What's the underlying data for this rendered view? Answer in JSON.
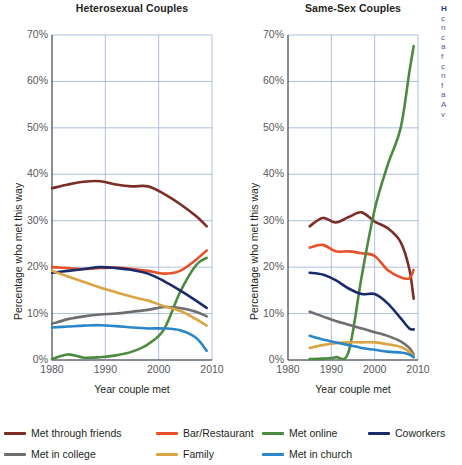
{
  "figure": {
    "xlabel": "Year couple met",
    "ylabel": "Percentage who met this way",
    "ytick_labels": [
      "0%",
      "10%",
      "20%",
      "30%",
      "40%",
      "50%",
      "60%",
      "70%"
    ],
    "xtick_labels": [
      "1980",
      "1990",
      "2000",
      "2010"
    ]
  },
  "caption": {
    "head": "H",
    "body": "c\nn\nc\na\nf\nc\nn\nf\na\nA\nv"
  },
  "legend": {
    "items": [
      {
        "label": "Met through friends",
        "color": "#7B2D26"
      },
      {
        "label": "Bar/Restaurant",
        "color": "#E8502A"
      },
      {
        "label": "Met online",
        "color": "#4A8B3F"
      },
      {
        "label": "Coworkers",
        "color": "#1B2A6B"
      },
      {
        "label": "Met in college",
        "color": "#6E6E6E"
      },
      {
        "label": "Family",
        "color": "#D9A441"
      },
      {
        "label": "Met in church",
        "color": "#2A86C8"
      }
    ]
  },
  "chart_data": [
    {
      "type": "line",
      "title": "Heterosexual Couples",
      "xlabel": "Year couple met",
      "ylabel": "Percentage who met this way",
      "xlim": [
        1980,
        2010
      ],
      "ylim": [
        0,
        70
      ],
      "grid": true,
      "legend_position": "below-figure",
      "x": [
        1980,
        1983,
        1986,
        1989,
        1992,
        1995,
        1998,
        2001,
        2004,
        2007,
        2009
      ],
      "series": [
        {
          "name": "Met through friends",
          "color": "#7B2D26",
          "values": [
            37.0,
            37.8,
            38.4,
            38.5,
            37.8,
            37.4,
            37.4,
            35.8,
            33.6,
            31.0,
            28.8
          ]
        },
        {
          "name": "Bar/Restaurant",
          "color": "#E8502A",
          "values": [
            20.0,
            19.8,
            19.6,
            19.8,
            19.9,
            19.6,
            19.2,
            18.6,
            19.2,
            21.6,
            23.6
          ]
        },
        {
          "name": "Met online",
          "color": "#4A8B3F",
          "values": [
            0.2,
            1.2,
            0.5,
            0.6,
            1.0,
            1.8,
            3.4,
            6.6,
            14.6,
            20.4,
            22.0
          ]
        },
        {
          "name": "Coworkers",
          "color": "#1B2A6B",
          "values": [
            18.8,
            19.2,
            19.6,
            20.0,
            19.8,
            19.4,
            18.6,
            17.0,
            15.0,
            12.8,
            11.2
          ]
        },
        {
          "name": "Met in college",
          "color": "#6E6E6E",
          "values": [
            7.8,
            8.8,
            9.4,
            9.8,
            10.0,
            10.4,
            10.8,
            11.4,
            11.2,
            10.4,
            9.4
          ]
        },
        {
          "name": "Family",
          "color": "#D9A441",
          "values": [
            19.2,
            18.0,
            16.8,
            15.6,
            14.6,
            13.6,
            12.8,
            11.6,
            10.6,
            8.8,
            7.4
          ]
        },
        {
          "name": "Met in church",
          "color": "#2A86C8",
          "values": [
            7.0,
            7.2,
            7.4,
            7.5,
            7.3,
            7.0,
            6.8,
            6.8,
            6.4,
            4.8,
            2.0
          ]
        }
      ]
    },
    {
      "type": "line",
      "title": "Same-Sex Couples",
      "xlabel": "Year couple met",
      "ylabel": "Percentage who met this way",
      "xlim": [
        1980,
        2010
      ],
      "ylim": [
        0,
        70
      ],
      "grid": true,
      "legend_position": "below-figure",
      "x": [
        1985,
        1988,
        1991,
        1994,
        1997,
        2000,
        2003,
        2006,
        2008,
        2009
      ],
      "series": [
        {
          "name": "Met through friends",
          "color": "#7B2D26",
          "values": [
            28.8,
            30.6,
            29.6,
            30.8,
            31.8,
            29.8,
            28.4,
            25.4,
            19.6,
            13.2
          ]
        },
        {
          "name": "Bar/Restaurant",
          "color": "#E8502A",
          "values": [
            24.2,
            24.8,
            23.4,
            23.4,
            23.0,
            22.4,
            19.4,
            17.8,
            17.6,
            19.4
          ]
        },
        {
          "name": "Met online",
          "color": "#4A8B3F",
          "values": [
            0.2,
            0.3,
            0.6,
            1.8,
            18.0,
            32.4,
            42.0,
            50.0,
            62.0,
            67.6
          ]
        },
        {
          "name": "Coworkers",
          "color": "#1B2A6B",
          "values": [
            18.8,
            18.4,
            17.2,
            15.4,
            14.2,
            14.2,
            12.2,
            9.0,
            6.8,
            6.6
          ]
        },
        {
          "name": "Met in college",
          "color": "#6E6E6E",
          "values": [
            10.4,
            9.4,
            8.4,
            7.6,
            6.8,
            6.0,
            5.2,
            4.0,
            2.6,
            1.2
          ]
        },
        {
          "name": "Family",
          "color": "#D9A441",
          "values": [
            2.6,
            3.2,
            3.6,
            3.8,
            3.8,
            3.8,
            3.4,
            2.8,
            1.8,
            0.8
          ]
        },
        {
          "name": "Met in church",
          "color": "#2A86C8",
          "values": [
            5.2,
            4.4,
            3.8,
            3.2,
            2.6,
            2.2,
            1.8,
            1.6,
            1.2,
            0.6
          ]
        }
      ]
    }
  ]
}
